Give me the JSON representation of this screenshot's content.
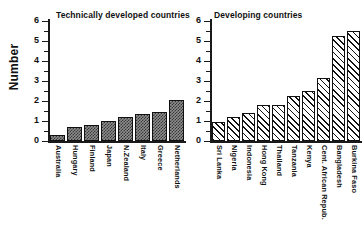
{
  "axis": {
    "ylabel": "Number",
    "tick_labels": [
      "6",
      "5",
      "4",
      "3",
      "2",
      "1",
      "0"
    ]
  },
  "chart_data": [
    {
      "type": "bar",
      "title": "Technically developed countries",
      "xlabel": "",
      "ylabel": "Number",
      "ylim": [
        0,
        6
      ],
      "yticks": [
        0,
        1,
        2,
        3,
        4,
        5,
        6
      ],
      "minor_ticks": true,
      "grid": false,
      "legend": "none",
      "fill_style": "dotted",
      "categories": [
        "Australia",
        "Hungary",
        "Finland",
        "Japan",
        "N.Zealand",
        "Italy",
        "Greece",
        "Netherlands"
      ],
      "values": [
        0.3,
        0.72,
        0.8,
        1.0,
        1.2,
        1.35,
        1.45,
        2.05
      ]
    },
    {
      "type": "bar",
      "title": "Developing countries",
      "xlabel": "",
      "ylabel": "Number",
      "ylim": [
        0,
        6
      ],
      "yticks": [
        0,
        1,
        2,
        3,
        4,
        5,
        6
      ],
      "minor_ticks": true,
      "grid": false,
      "legend": "none",
      "fill_style": "diagonal-hatch",
      "categories": [
        "Sri Lanka",
        "Nigeria",
        "Indonesia",
        "Hong Kong",
        "Thailand",
        "Tanzania",
        "Kenya",
        "Cent. African Repub.",
        "Bangladesh",
        "Burkina Faso"
      ],
      "values": [
        0.95,
        1.2,
        1.4,
        1.8,
        1.8,
        2.25,
        2.5,
        3.15,
        5.25,
        5.5
      ]
    }
  ]
}
